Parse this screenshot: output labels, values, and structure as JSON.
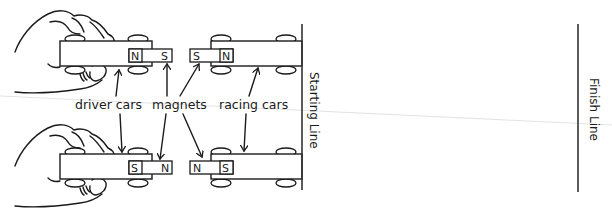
{
  "diagram": {
    "labels": {
      "driver_cars": "driver cars",
      "magnets": "magnets",
      "racing_cars": "racing cars",
      "starting_line": "Starting Line",
      "finish_line": "Finish Line"
    },
    "top_pair": {
      "driver_car_magnet": {
        "left_pole": "N",
        "right_pole": "S"
      },
      "racing_car_magnet": {
        "left_pole": "S",
        "right_pole": "N"
      }
    },
    "bottom_pair": {
      "driver_car_magnet": {
        "left_pole": "S",
        "right_pole": "N"
      },
      "racing_car_magnet": {
        "left_pole": "N",
        "right_pole": "S"
      }
    },
    "colors": {
      "ink": "#1a1a1a",
      "background": "#ffffff"
    }
  }
}
